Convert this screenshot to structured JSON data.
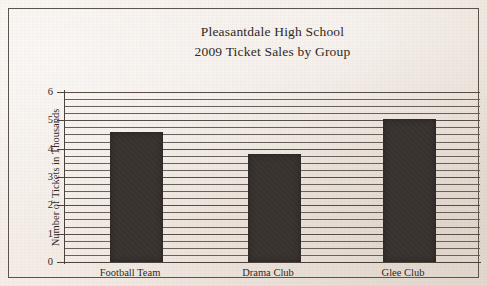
{
  "chart_data": {
    "type": "bar",
    "title": "Pleasantdale High School 2009 Ticket Sales by Group",
    "title_lines": [
      "Pleasantdale High School",
      "2009 Ticket Sales by Group"
    ],
    "categories": [
      "Football Team",
      "Drama Club",
      "Glee Club"
    ],
    "values": [
      4.6,
      3.8,
      5.05
    ],
    "xlabel": "",
    "ylabel": "Number of Tickets in Thousands",
    "ylim": [
      0,
      6
    ],
    "ytick_labels": [
      "6",
      "5",
      "4",
      "3",
      "2",
      "1",
      "0"
    ],
    "ytick_values": [
      6,
      5,
      4,
      3,
      2,
      1,
      0
    ],
    "grid": true,
    "grid_orientation": "horizontal",
    "grid_minor_per_unit": 4,
    "legend": null,
    "bar_color": "#393330",
    "background_color": "#f2ebe5",
    "axis_color": "#4b423c",
    "text_color": "#2e2924"
  }
}
